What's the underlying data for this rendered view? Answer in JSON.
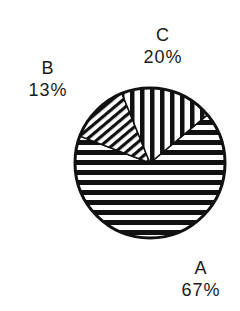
{
  "chart_data": {
    "type": "pie",
    "title": "",
    "categories": [
      "A",
      "B",
      "C"
    ],
    "values": [
      67,
      13,
      20
    ],
    "unit": "%",
    "slices": [
      {
        "label": "A",
        "value": 67,
        "value_text": "67%",
        "fill": "horizontal-hatch",
        "start_deg": -40,
        "end_deg": 201
      },
      {
        "label": "B",
        "value": 13,
        "value_text": "13%",
        "fill": "diagonal-hatch",
        "start_deg": 201,
        "end_deg": 248
      },
      {
        "label": "C",
        "value": 20,
        "value_text": "20%",
        "fill": "vertical-hatch",
        "start_deg": 248,
        "end_deg": 320
      }
    ],
    "legend": "none (labels placed outside slices)"
  },
  "labels": {
    "a_name": "A",
    "a_value": "67%",
    "b_name": "B",
    "b_value": "13%",
    "c_name": "C",
    "c_value": "20%"
  },
  "colors": {
    "ink": "#111111",
    "background": "#ffffff"
  }
}
